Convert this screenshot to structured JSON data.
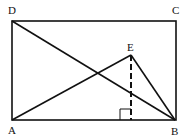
{
  "diagram": {
    "type": "geometry-figure",
    "points": {
      "A": {
        "label": "A",
        "x": 12,
        "y": 120
      },
      "B": {
        "label": "B",
        "x": 175,
        "y": 120
      },
      "C": {
        "label": "C",
        "x": 176,
        "y": 21
      },
      "D": {
        "label": "D",
        "x": 12,
        "y": 21
      },
      "E": {
        "label": "E",
        "x": 131,
        "y": 55
      }
    },
    "segments": [
      {
        "from": "A",
        "to": "B",
        "style": "solid"
      },
      {
        "from": "B",
        "to": "C",
        "style": "solid"
      },
      {
        "from": "C",
        "to": "D",
        "style": "solid"
      },
      {
        "from": "D",
        "to": "A",
        "style": "solid"
      },
      {
        "from": "D",
        "to": "B",
        "style": "solid"
      },
      {
        "from": "A",
        "to": "E",
        "style": "solid"
      },
      {
        "from": "E",
        "to": "B",
        "style": "solid"
      },
      {
        "from": "E",
        "to": "foot",
        "style": "dashed"
      }
    ],
    "right_angle_mark": {
      "at": "foot of altitude from E on AB"
    },
    "colors": {
      "stroke": "#111111",
      "background": "#ffffff"
    }
  }
}
